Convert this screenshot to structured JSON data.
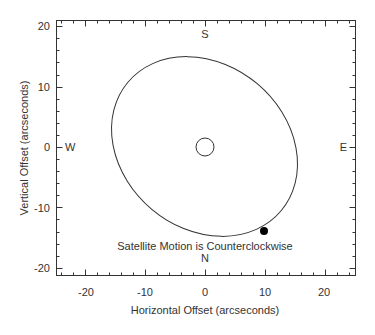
{
  "chart_data": {
    "type": "scatter",
    "title": "",
    "xlabel": "Horizontal Offset (arcseconds)",
    "ylabel": "Vertical Offset (arcseconds)",
    "xlim": [
      -25,
      25
    ],
    "ylim": [
      -21,
      21
    ],
    "xticks": [
      "-20",
      "-10",
      "0",
      "10",
      "20"
    ],
    "yticks": [
      "20",
      "10",
      "0",
      "-10",
      "-20"
    ],
    "grid": false,
    "series": [
      {
        "name": "Satellite orbit (ellipse)",
        "center": [
          0,
          0
        ],
        "x_extent": [
          -15.3,
          15.2
        ],
        "y_extent": [
          -15.1,
          15.2
        ]
      },
      {
        "name": "Central object",
        "x": [
          0
        ],
        "y": [
          0
        ],
        "radius_arcsec": 1.5
      },
      {
        "name": "Satellite position",
        "x": [
          10
        ],
        "y": [
          -13.8
        ]
      }
    ],
    "annotations": [
      "S",
      "N",
      "W",
      "E",
      "Satellite Motion is Counterclockwise"
    ]
  },
  "labels": {
    "south": "S",
    "north": "N",
    "west": "W",
    "east": "E",
    "motion_note": "Satellite Motion is Counterclockwise",
    "xlabel": "Horizontal Offset (arcseconds)",
    "ylabel": "Vertical Offset (arcseconds)",
    "xticks": [
      "-20",
      "-10",
      "0",
      "10",
      "20"
    ],
    "yticks": [
      "20",
      "10",
      "0",
      "-10",
      "-20"
    ]
  }
}
